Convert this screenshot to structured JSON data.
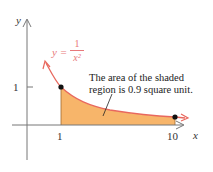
{
  "diagram": {
    "axes": {
      "x_label": "x",
      "y_label": "y"
    },
    "ticks": {
      "x": [
        "1",
        "10"
      ],
      "y": [
        "1"
      ]
    },
    "curve": {
      "equation_lhs": "y =",
      "numerator": "1",
      "denominator": "x²"
    },
    "annotation": {
      "line1": "The area of the shaded",
      "line2": "region is 0.9 square unit."
    },
    "colors": {
      "fill": "#f7b56a",
      "curve": "#e8685e",
      "axis": "#555555"
    },
    "points": [
      {
        "x": 1,
        "y": 1
      },
      {
        "x": 10,
        "y": 0.01
      }
    ],
    "shaded_region": {
      "from_x": 1,
      "to_x": 10,
      "area": 0.9
    }
  }
}
